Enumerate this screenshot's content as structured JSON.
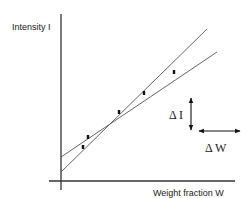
{
  "chart_data": {
    "type": "scatter",
    "title": "",
    "ylabel": "Intensity I",
    "xlabel": "Weight fraction W",
    "axes": {
      "origin": [
        61,
        181
      ],
      "y_axis_top": 14,
      "y_axis_bottom": 190,
      "x_axis_right": 235
    },
    "points": [
      {
        "x": 83,
        "y": 147
      },
      {
        "x": 88,
        "y": 137
      },
      {
        "x": 119,
        "y": 112
      },
      {
        "x": 144,
        "y": 93
      },
      {
        "x": 174,
        "y": 72
      }
    ],
    "lines": [
      {
        "name": "steep-fit",
        "x1": 61,
        "y1": 172,
        "x2": 207,
        "y2": 29
      },
      {
        "name": "shallow-fit",
        "x1": 61,
        "y1": 157,
        "x2": 217,
        "y2": 52
      }
    ],
    "annotations": {
      "delta_i": {
        "label": "Δ I",
        "arrow": {
          "x": 191,
          "y1": 98,
          "y2": 130
        }
      },
      "delta_w": {
        "label": "Δ W",
        "arrow": {
          "y": 131,
          "x1": 199,
          "x2": 240
        }
      }
    },
    "grid": false,
    "legend": null
  }
}
